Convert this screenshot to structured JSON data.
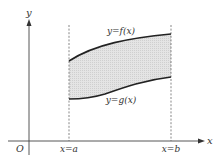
{
  "figure": {
    "type": "area-between-curves",
    "axes": {
      "x_label": "x",
      "y_label": "y",
      "origin_label": "O"
    },
    "bounds": {
      "left_label": "x=a",
      "right_label": "x=b"
    },
    "curves": {
      "upper_label": "y=f(x)",
      "lower_label": "y=g(x)"
    },
    "colors": {
      "region_fill": "#d9d9d9",
      "curve_stroke": "#222222",
      "axis_stroke": "#444444"
    }
  }
}
